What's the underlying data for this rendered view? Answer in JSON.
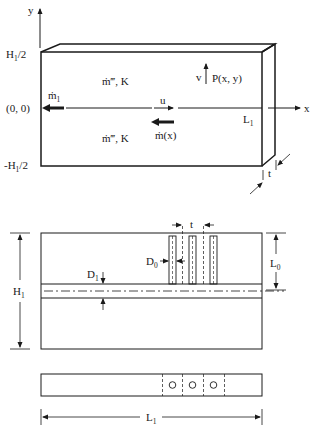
{
  "figure": {
    "top_view": {
      "axis_y_label": "y",
      "axis_x_label": "x",
      "y_top_label": "H",
      "y_top_sub": "1",
      "y_top_suffix": "/2",
      "origin_label": "(0, 0)",
      "y_bottom_prefix": "-H",
      "y_bottom_sub": "1",
      "y_bottom_suffix": "/2",
      "source_upper": "ṁ‴, K",
      "source_lower": "ṁ‴, K",
      "outlet_flow": "ṁ",
      "outlet_flow_sub": "1",
      "velocity_u": "u",
      "velocity_v": "v",
      "point_label": "P(x, y)",
      "local_flow": "ṁ(x)",
      "length_label": "L",
      "length_sub": "1",
      "thickness_label": "t"
    },
    "front_view": {
      "height_label": "H",
      "height_sub": "1",
      "pitch_label": "t",
      "tube_diameter_label": "D",
      "tube_diameter_sub": "0",
      "channel_diameter_label": "D",
      "channel_diameter_sub": "1",
      "tube_length_label": "L",
      "tube_length_sub": "0"
    },
    "side_view": {
      "length_label": "L",
      "length_sub": "1",
      "hole_count": 3
    }
  }
}
